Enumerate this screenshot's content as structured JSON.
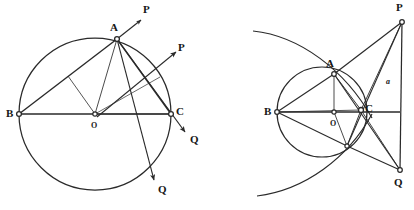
{
  "figure": {
    "stroke_color": "#2a2a2a",
    "background_color": "#ffffff",
    "node_fill": "#ffffff"
  },
  "left_figure": {
    "name": "circle-with-diameter-and-rays",
    "circle": {
      "cx": 95,
      "cy": 114,
      "r": 76
    },
    "points": [
      {
        "id": "A",
        "label": "A",
        "x": 117,
        "y": 39,
        "label_x": 110,
        "label_y": 22
      },
      {
        "id": "B",
        "label": "B",
        "x": 19,
        "y": 114,
        "label_x": 6,
        "label_y": 108
      },
      {
        "id": "C",
        "label": "C",
        "x": 171,
        "y": 114,
        "label_x": 176,
        "label_y": 106
      },
      {
        "id": "O",
        "label": "O",
        "x": 95,
        "y": 114,
        "label_x": 91,
        "label_y": 120
      }
    ],
    "ray_labels": [
      {
        "id": "P1",
        "label": "P",
        "x": 143,
        "y": 4
      },
      {
        "id": "P2",
        "label": "P",
        "x": 178,
        "y": 42
      },
      {
        "id": "Q1",
        "label": "Q",
        "x": 190,
        "y": 134
      },
      {
        "id": "Q2",
        "label": "Q",
        "x": 158,
        "y": 184
      }
    ]
  },
  "right_figure": {
    "name": "circle-with-external-point-and-arcs",
    "circle": {
      "cx": 322,
      "cy": 112,
      "r": 45
    },
    "arcs": {
      "upper_arc_desc": "large arc sweeping from upper-left through A toward lower right",
      "lower_arc_desc": "large arc sweeping from lower-left up through C region"
    },
    "points": [
      {
        "id": "A",
        "label": "A",
        "x": 334,
        "y": 74,
        "label_x": 326,
        "label_y": 58
      },
      {
        "id": "B",
        "label": "B",
        "x": 277,
        "y": 112,
        "label_x": 264,
        "label_y": 106
      },
      {
        "id": "C",
        "label": "C",
        "x": 361,
        "y": 110,
        "label_x": 365,
        "label_y": 103
      },
      {
        "id": "O",
        "label": "O",
        "x": 334,
        "y": 112,
        "label_x": 330,
        "label_y": 118
      },
      {
        "id": "P",
        "label": "P",
        "x": 402,
        "y": 22,
        "label_x": 396,
        "label_y": 2
      },
      {
        "id": "Q",
        "label": "Q",
        "x": 400,
        "y": 170,
        "label_x": 394,
        "label_y": 177
      },
      {
        "id": "D",
        "label": "",
        "x": 347,
        "y": 146,
        "label_x": 0,
        "label_y": 0
      }
    ],
    "side_label": {
      "id": "a",
      "label": "a",
      "x": 386,
      "y": 76
    }
  }
}
